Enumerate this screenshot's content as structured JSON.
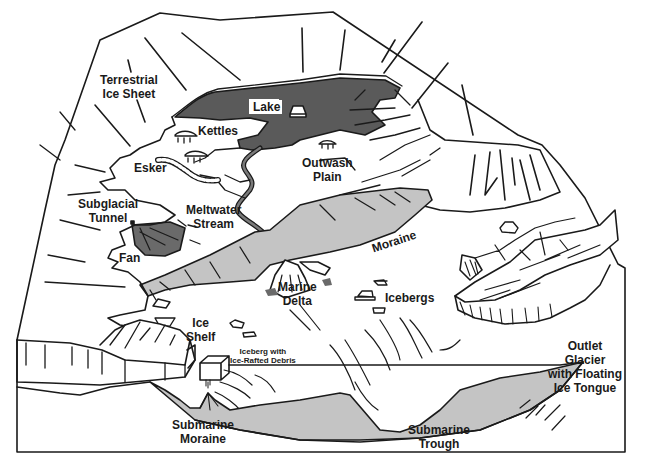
{
  "diagram": {
    "colors": {
      "line": "#1a1a1a",
      "lake": "#5a5a5a",
      "moraine": "#c4c4c4",
      "fan": "#6a6a6a",
      "background": "#ffffff"
    },
    "labels": {
      "terrestrial_ice_sheet_1": "Terrestrial",
      "terrestrial_ice_sheet_2": "Ice Sheet",
      "lake": "Lake",
      "kettles": "Kettles",
      "esker": "Esker",
      "outwash_plain_1": "Outwash",
      "outwash_plain_2": "Plain",
      "subglacial_tunnel_1": "Subglacial",
      "subglacial_tunnel_2": "Tunnel",
      "meltwater_stream_1": "Meltwater",
      "meltwater_stream_2": "Stream",
      "moraine": "Moraine",
      "fan": "Fan",
      "marine_delta_1": "Marine",
      "marine_delta_2": "Delta",
      "icebergs": "Icebergs",
      "ice_shelf_1": "Ice",
      "ice_shelf_2": "Shelf",
      "iceberg_debris_1": "Iceberg with",
      "iceberg_debris_2": "Ice-Rafted Debris",
      "outlet_glacier_1": "Outlet",
      "outlet_glacier_2": "Glacier",
      "outlet_glacier_3": "with Floating",
      "outlet_glacier_4": "Ice Tongue",
      "submarine_moraine_1": "Submarine",
      "submarine_moraine_2": "Moraine",
      "submarine_trough_1": "Submarine",
      "submarine_trough_2": "Trough"
    }
  }
}
